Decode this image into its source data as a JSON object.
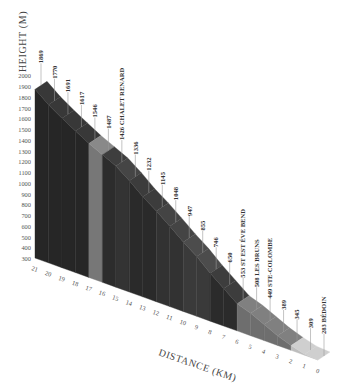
{
  "chart_data": {
    "type": "area",
    "style": "isometric-3d elevation profile",
    "title": "",
    "xlabel": "DISTANCE (KM)",
    "ylabel": "HEIGHT (M)",
    "ylim": [
      300,
      2000
    ],
    "yticks": [
      2000,
      1900,
      1800,
      1700,
      1600,
      1500,
      1400,
      1300,
      1200,
      1100,
      1000,
      900,
      800,
      700,
      600,
      500,
      400,
      300
    ],
    "xticks": [
      21,
      20,
      19,
      18,
      17,
      16,
      15,
      14,
      13,
      12,
      11,
      10,
      9,
      8,
      7,
      6,
      5,
      4,
      3,
      2,
      1,
      0
    ],
    "grid": false,
    "legend": null,
    "points": [
      {
        "km": 0,
        "height": 283,
        "label": "283 BÉDOIN"
      },
      {
        "km": 1,
        "height": 309,
        "label": "309"
      },
      {
        "km": 2,
        "height": 345,
        "label": "345"
      },
      {
        "km": 3,
        "height": 389,
        "label": "389"
      },
      {
        "km": 4,
        "height": 449,
        "label": "449 STE-COLOMBE"
      },
      {
        "km": 5,
        "height": 508,
        "label": "508 LES BRUNS"
      },
      {
        "km": 6,
        "height": 553,
        "label": "553 ST EST ÉVE BEND"
      },
      {
        "km": 7,
        "height": 650,
        "label": "650"
      },
      {
        "km": 8,
        "height": 746,
        "label": "746"
      },
      {
        "km": 9,
        "height": 855,
        "label": "855"
      },
      {
        "km": 10,
        "height": 947,
        "label": "947"
      },
      {
        "km": 11,
        "height": 1048,
        "label": "1048"
      },
      {
        "km": 12,
        "height": 1145,
        "label": "1145"
      },
      {
        "km": 13,
        "height": 1232,
        "label": "1232"
      },
      {
        "km": 14,
        "height": 1336,
        "label": "1336"
      },
      {
        "km": 15,
        "height": 1426,
        "label": "1426 CHALET RENARD"
      },
      {
        "km": 16,
        "height": 1487,
        "label": "1487"
      },
      {
        "km": 17,
        "height": 1546,
        "label": "1546"
      },
      {
        "km": 18,
        "height": 1617,
        "label": "1617"
      },
      {
        "km": 19,
        "height": 1691,
        "label": "1691"
      },
      {
        "km": 20,
        "height": 1770,
        "label": "1770"
      },
      {
        "km": 21,
        "height": 1869,
        "label": "1869"
      }
    ],
    "segment_colors": {
      "0-2": "#bdbdbd",
      "2-6": "#6e6e6e",
      "6-8": "#2b2b2b",
      "8-10": "#3a3a3a",
      "10-12": "#323232",
      "12-14": "#2a2a2a",
      "14-15": "#333333",
      "15-16": "#2c2c2c",
      "16-17": "#777777",
      "17-21": "#262626"
    }
  },
  "axes": {
    "y_title": "HEIGHT (M)",
    "x_title": "DISTANCE (KM)"
  }
}
